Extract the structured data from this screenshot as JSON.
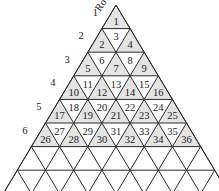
{
  "diagram": {
    "title_fragment": "Ro",
    "apex": [
      116,
      5
    ],
    "row_height": 23.6,
    "half_width": 14.1,
    "numbered_rows": 6,
    "total_rows_drawn": 8,
    "shade_color": "#e4e4e4",
    "line_color": "#2a2a2a",
    "row_labels": [
      "1",
      "2",
      "3",
      "4",
      "5",
      "6"
    ],
    "cells": [
      [
        "1"
      ],
      [
        "2",
        "3",
        "4"
      ],
      [
        "5",
        "6",
        "7",
        "8",
        "9"
      ],
      [
        "10",
        "11",
        "12",
        "13",
        "14",
        "15",
        "16"
      ],
      [
        "17",
        "18",
        "19",
        "20",
        "21",
        "22",
        "23",
        "24",
        "25"
      ],
      [
        "26",
        "27",
        "28",
        "29",
        "30",
        "31",
        "32",
        "33",
        "34",
        "35",
        "36"
      ]
    ]
  }
}
